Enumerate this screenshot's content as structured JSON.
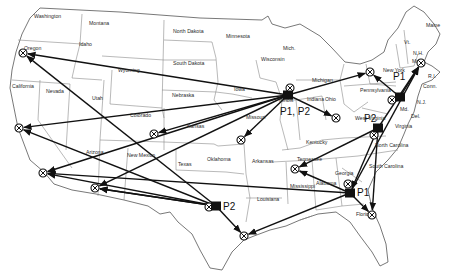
{
  "map": {
    "title": "",
    "colors": {
      "ink": "#111111",
      "border": "#8a8a8a",
      "background": "#ffffff"
    },
    "states": [
      {
        "name": "Washington",
        "x": 34,
        "y": 18
      },
      {
        "name": "Montana",
        "x": 89,
        "y": 25
      },
      {
        "name": "Idaho",
        "x": 79,
        "y": 46
      },
      {
        "name": "Oregon",
        "x": 24,
        "y": 50
      },
      {
        "name": "North Dakota",
        "x": 173,
        "y": 33
      },
      {
        "name": "Minnesota",
        "x": 226,
        "y": 38
      },
      {
        "name": "South Dakota",
        "x": 173,
        "y": 65
      },
      {
        "name": "Wyoming",
        "x": 118,
        "y": 72
      },
      {
        "name": "Wisconsin",
        "x": 261,
        "y": 61
      },
      {
        "name": "Mich.",
        "x": 283,
        "y": 50
      },
      {
        "name": "Michigan",
        "x": 312,
        "y": 82
      },
      {
        "name": "Iowa",
        "x": 234,
        "y": 91
      },
      {
        "name": "Nebraska",
        "x": 172,
        "y": 97
      },
      {
        "name": "California",
        "x": 12,
        "y": 88
      },
      {
        "name": "Nevada",
        "x": 46,
        "y": 93
      },
      {
        "name": "Utah",
        "x": 92,
        "y": 100
      },
      {
        "name": "Colorado",
        "x": 130,
        "y": 117
      },
      {
        "name": "Kansas",
        "x": 187,
        "y": 128
      },
      {
        "name": "Missouri",
        "x": 246,
        "y": 119
      },
      {
        "name": "Illinois",
        "x": 279,
        "y": 102
      },
      {
        "name": "Indiana",
        "x": 307,
        "y": 101
      },
      {
        "name": "Ohio",
        "x": 325,
        "y": 101
      },
      {
        "name": "Arizona",
        "x": 86,
        "y": 154
      },
      {
        "name": "New Mexico",
        "x": 127,
        "y": 157
      },
      {
        "name": "Texas",
        "x": 178,
        "y": 166
      },
      {
        "name": "Oklahoma",
        "x": 207,
        "y": 161
      },
      {
        "name": "Arkansas",
        "x": 252,
        "y": 163
      },
      {
        "name": "Kentucky",
        "x": 306,
        "y": 144
      },
      {
        "name": "Tennessee",
        "x": 297,
        "y": 161
      },
      {
        "name": "Louisiana",
        "x": 257,
        "y": 201
      },
      {
        "name": "Mississippi",
        "x": 290,
        "y": 188
      },
      {
        "name": "Alabama",
        "x": 316,
        "y": 185
      },
      {
        "name": "Georgia",
        "x": 335,
        "y": 175
      },
      {
        "name": "South Carolina",
        "x": 369,
        "y": 168
      },
      {
        "name": "North Carolina",
        "x": 375,
        "y": 147
      },
      {
        "name": "Virginia",
        "x": 395,
        "y": 128
      },
      {
        "name": "West Virginia",
        "x": 355,
        "y": 120
      },
      {
        "name": "Pennsylvania",
        "x": 360,
        "y": 92
      },
      {
        "name": "New York",
        "x": 383,
        "y": 72
      },
      {
        "name": "Vt.",
        "x": 404,
        "y": 44
      },
      {
        "name": "N.H.",
        "x": 413,
        "y": 55
      },
      {
        "name": "Maine",
        "x": 426,
        "y": 27
      },
      {
        "name": "Mass.",
        "x": 412,
        "y": 63
      },
      {
        "name": "R.I.",
        "x": 428,
        "y": 78
      },
      {
        "name": "Conn.",
        "x": 423,
        "y": 88
      },
      {
        "name": "N.J.",
        "x": 417,
        "y": 104
      },
      {
        "name": "Del.",
        "x": 411,
        "y": 118
      },
      {
        "name": "Md.",
        "x": 400,
        "y": 111
      },
      {
        "name": "Florida",
        "x": 356,
        "y": 216
      }
    ],
    "plants": [
      {
        "id": "chicago",
        "label": "P1, P2",
        "x": 288,
        "y": 95,
        "label_x": 280,
        "label_y": 115
      },
      {
        "id": "pennsylvania",
        "label": "P1",
        "x": 400,
        "y": 97,
        "label_x": 393,
        "label_y": 80
      },
      {
        "id": "virginia",
        "label": "P2",
        "x": 378,
        "y": 128,
        "label_x": 364,
        "label_y": 122
      },
      {
        "id": "georgia",
        "label": "P1",
        "x": 350,
        "y": 193,
        "label_x": 357,
        "label_y": 196
      },
      {
        "id": "texas",
        "label": "P2",
        "x": 216,
        "y": 206,
        "label_x": 223,
        "label_y": 210
      }
    ],
    "distribution_centers": [
      {
        "id": "oregon",
        "x": 23,
        "y": 53
      },
      {
        "id": "n-california",
        "x": 19,
        "y": 128
      },
      {
        "id": "s-california",
        "x": 43,
        "y": 173
      },
      {
        "id": "arizona",
        "x": 95,
        "y": 188
      },
      {
        "id": "kansas",
        "x": 154,
        "y": 134
      },
      {
        "id": "missouri",
        "x": 241,
        "y": 140
      },
      {
        "id": "ohio",
        "x": 336,
        "y": 118
      },
      {
        "id": "new-york",
        "x": 370,
        "y": 72
      },
      {
        "id": "boston",
        "x": 421,
        "y": 63
      },
      {
        "id": "chicago-dc",
        "x": 290,
        "y": 88
      },
      {
        "id": "philadelphia-dc",
        "x": 392,
        "y": 100
      },
      {
        "id": "virginia-dc",
        "x": 374,
        "y": 135
      },
      {
        "id": "tennessee",
        "x": 295,
        "y": 169
      },
      {
        "id": "atlanta-dc",
        "x": 348,
        "y": 184
      },
      {
        "id": "florida",
        "x": 372,
        "y": 215
      },
      {
        "id": "texas-dc",
        "x": 209,
        "y": 207
      },
      {
        "id": "houston",
        "x": 244,
        "y": 236
      }
    ],
    "routes": [
      {
        "from": [
          288,
          95
        ],
        "to": [
          23,
          53
        ]
      },
      {
        "from": [
          288,
          95
        ],
        "to": [
          19,
          128
        ]
      },
      {
        "from": [
          288,
          95
        ],
        "to": [
          43,
          173
        ]
      },
      {
        "from": [
          288,
          95
        ],
        "to": [
          95,
          188
        ]
      },
      {
        "from": [
          288,
          95
        ],
        "to": [
          154,
          134
        ]
      },
      {
        "from": [
          288,
          95
        ],
        "to": [
          241,
          140
        ]
      },
      {
        "from": [
          288,
          95
        ],
        "to": [
          336,
          118
        ]
      },
      {
        "from": [
          288,
          95
        ],
        "to": [
          370,
          72
        ]
      },
      {
        "from": [
          400,
          97
        ],
        "to": [
          370,
          72
        ]
      },
      {
        "from": [
          400,
          97
        ],
        "to": [
          421,
          63
        ]
      },
      {
        "from": [
          378,
          128
        ],
        "to": [
          421,
          63
        ]
      },
      {
        "from": [
          378,
          128
        ],
        "to": [
          350,
          193
        ]
      },
      {
        "from": [
          378,
          128
        ],
        "to": [
          372,
          215
        ]
      },
      {
        "from": [
          350,
          193
        ],
        "to": [
          421,
          63
        ]
      },
      {
        "from": [
          350,
          193
        ],
        "to": [
          295,
          169
        ]
      },
      {
        "from": [
          350,
          193
        ],
        "to": [
          372,
          215
        ]
      },
      {
        "from": [
          350,
          193
        ],
        "to": [
          244,
          236
        ]
      },
      {
        "from": [
          350,
          193
        ],
        "to": [
          43,
          173
        ]
      },
      {
        "from": [
          378,
          128
        ],
        "to": [
          295,
          169
        ]
      },
      {
        "from": [
          216,
          206
        ],
        "to": [
          23,
          53
        ]
      },
      {
        "from": [
          216,
          206
        ],
        "to": [
          43,
          173
        ]
      },
      {
        "from": [
          216,
          206
        ],
        "to": [
          95,
          188
        ]
      },
      {
        "from": [
          216,
          206
        ],
        "to": [
          19,
          128
        ]
      },
      {
        "from": [
          216,
          206
        ],
        "to": [
          244,
          236
        ]
      },
      {
        "from": [
          216,
          206
        ],
        "to": [
          95,
          188
        ]
      }
    ]
  }
}
